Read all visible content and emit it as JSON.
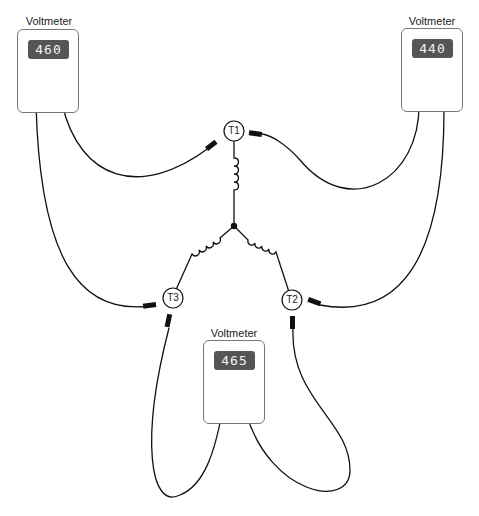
{
  "diagram": {
    "type": "wye-connected three-phase winding voltage measurement",
    "voltmeters": [
      {
        "id": "left",
        "label": "Voltmeter",
        "reading": "460",
        "connected_between": [
          "T1",
          "T3"
        ]
      },
      {
        "id": "right",
        "label": "Voltmeter",
        "reading": "440",
        "connected_between": [
          "T1",
          "T2"
        ]
      },
      {
        "id": "bottom",
        "label": "Voltmeter",
        "reading": "465",
        "connected_between": [
          "T3",
          "T2"
        ]
      }
    ],
    "terminals": [
      {
        "id": "T1",
        "label": "T1"
      },
      {
        "id": "T2",
        "label": "T2"
      },
      {
        "id": "T3",
        "label": "T3"
      }
    ],
    "colors": {
      "line": "#111111",
      "display_bg": "#555555",
      "display_text": "#f2f2f2",
      "meter_border": "#777777"
    }
  }
}
